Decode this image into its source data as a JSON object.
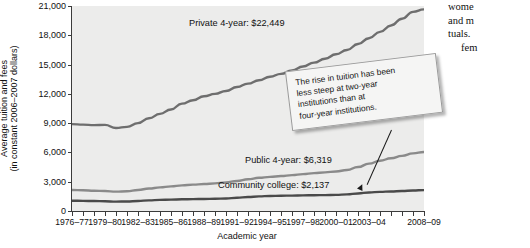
{
  "page": {
    "body_text_fragments": [
      "wome",
      "and  m",
      "tuals.",
      "fem"
    ]
  },
  "chart_data": {
    "type": "line",
    "title": "",
    "xlabel": "Academic year",
    "ylabel": "Average tuition and fees (in constant 2006–2007 dollars)",
    "ylabel_line1": "Average tuition and fees",
    "ylabel_line2": "(in constant 2006–2007 dollars)",
    "ylim": [
      0,
      21000
    ],
    "ytick_labels": [
      "0",
      "3,000",
      "6,000",
      "9,000",
      "12,000",
      "15,000",
      "18,000",
      "21,000"
    ],
    "ytick_values": [
      0,
      3000,
      6000,
      9000,
      12000,
      15000,
      18000,
      21000
    ],
    "grid": false,
    "legend_position": "inline-labels",
    "x": [
      "1976–77",
      "1977–78",
      "1978–79",
      "1979–80",
      "1980–81",
      "1981–82",
      "1982–83",
      "1983–84",
      "1984–85",
      "1985–86",
      "1986–87",
      "1987–88",
      "1988–89",
      "1989–90",
      "1990–91",
      "1991–92",
      "1992–93",
      "1993–94",
      "1994–95",
      "1995–96",
      "1996–97",
      "1997–98",
      "1998–99",
      "1999–2000",
      "2000–01",
      "2001–02",
      "2002–03",
      "2003–04",
      "2004–05",
      "2005–06",
      "2006–07",
      "2007–08",
      "2008–09"
    ],
    "xtick_labels": [
      "1976–77",
      "1979–80",
      "1982–83",
      "1985–86",
      "1988–89",
      "1991–92",
      "1994–95",
      "1997–98",
      "2000–01",
      "2003–04",
      "2008–09"
    ],
    "xtick_indices": [
      0,
      3,
      6,
      9,
      12,
      15,
      18,
      21,
      24,
      27,
      32
    ],
    "series": [
      {
        "name": "Private 4-year",
        "label": "Private 4-year: $22,449",
        "end_value": 22449,
        "color": "#6e6e6e",
        "values": [
          8900,
          8850,
          8800,
          8820,
          8500,
          8620,
          9000,
          9500,
          9950,
          10400,
          11000,
          11350,
          11750,
          12000,
          12300,
          12700,
          13050,
          13400,
          13750,
          14050,
          14400,
          14800,
          15200,
          15600,
          16050,
          16500,
          17100,
          17700,
          18350,
          19000,
          19700,
          20400,
          20650
        ]
      },
      {
        "name": "Public 4-year",
        "label": "Public 4-year: $6,319",
        "end_value": 6319,
        "color": "#8a8a8a",
        "values": [
          2150,
          2120,
          2080,
          2050,
          1980,
          2020,
          2150,
          2300,
          2420,
          2520,
          2620,
          2700,
          2760,
          2830,
          2920,
          3080,
          3250,
          3400,
          3500,
          3580,
          3680,
          3780,
          3880,
          3960,
          4050,
          4200,
          4500,
          4850,
          5150,
          5400,
          5650,
          5900,
          6050
        ]
      },
      {
        "name": "Community college",
        "label": "Community college: $2,137",
        "end_value": 2137,
        "color": "#4a4a4a",
        "values": [
          1050,
          1040,
          1020,
          1000,
          960,
          980,
          1030,
          1090,
          1140,
          1170,
          1200,
          1220,
          1230,
          1250,
          1280,
          1350,
          1430,
          1500,
          1540,
          1560,
          1580,
          1600,
          1620,
          1630,
          1650,
          1700,
          1800,
          1900,
          1960,
          2000,
          2050,
          2100,
          2137
        ]
      }
    ],
    "annotations": [
      {
        "id": "callout",
        "text": "The rise in tuition has been less steep at two-year institutions than at four-year institutions.",
        "lines": [
          "The rise in tuition has been",
          "less steep at two-year",
          "institutions than at",
          "four-year institutions."
        ]
      }
    ],
    "colors": {
      "plot_background": "#ececeb",
      "axis": "#3b3b3b",
      "private": "#6e6e6e",
      "public": "#8a8a8a",
      "community": "#4a4a4a"
    }
  }
}
